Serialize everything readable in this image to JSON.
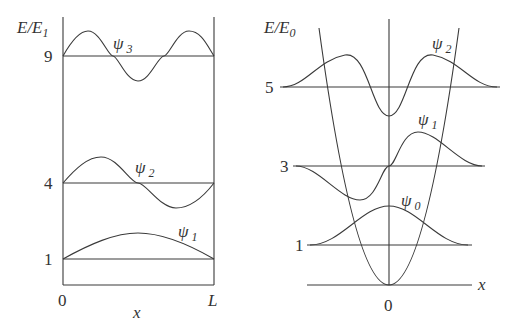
{
  "left_panel": {
    "title": "Infinite square well",
    "y_axis_label": "E/E",
    "y_axis_label_sub": "1",
    "x_axis_label": "x",
    "x_ticks": [
      "0",
      "L"
    ],
    "levels": [
      {
        "value": "9",
        "psi_label": "ψ",
        "psi_sub": "3"
      },
      {
        "value": "4",
        "psi_label": "ψ",
        "psi_sub": "2"
      },
      {
        "value": "1",
        "psi_label": "ψ",
        "psi_sub": "1"
      }
    ]
  },
  "right_panel": {
    "title": "Harmonic oscillator",
    "y_axis_label": "E/E",
    "y_axis_label_sub": "0",
    "x_axis_label": "x",
    "x_ticks": [
      "0"
    ],
    "levels": [
      {
        "value": "5",
        "psi_label": "ψ",
        "psi_sub": "2"
      },
      {
        "value": "3",
        "psi_label": "ψ",
        "psi_sub": "1"
      },
      {
        "value": "1",
        "psi_label": "ψ",
        "psi_sub": "0"
      }
    ]
  },
  "colors": {
    "line": "#3a3a3a",
    "text": "#333333",
    "background": "#ffffff"
  }
}
